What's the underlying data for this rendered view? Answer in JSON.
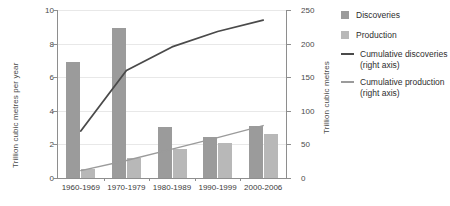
{
  "chart_data": {
    "type": "bar",
    "title": "",
    "subtitle": "",
    "categories": [
      "1960-1969",
      "1970-1979",
      "1980-1989",
      "1990-1999",
      "2000-2006"
    ],
    "ylabel": "Trillion cubic metres per year",
    "ylabel_right": "Trillion cubic metres",
    "xlabel": "",
    "ylim": [
      0,
      10
    ],
    "ylim_right": [
      0,
      250
    ],
    "yticks": [
      "0",
      "2",
      "4",
      "6",
      "8",
      "10"
    ],
    "yticks_right": [
      "0",
      "50",
      "100",
      "150",
      "200",
      "250"
    ],
    "grid": true,
    "legend_position": "right",
    "series": [
      {
        "name": "Discoveries",
        "kind": "bar",
        "axis": "left",
        "color": "#9b9b9b",
        "values": [
          6.9,
          8.9,
          3.05,
          2.45,
          3.1
        ]
      },
      {
        "name": "Production",
        "kind": "bar",
        "axis": "left",
        "color": "#b8b8b8",
        "values": [
          0.55,
          1.2,
          1.7,
          2.1,
          2.6
        ]
      },
      {
        "name": "Cumulative discoveries (right axis)",
        "kind": "line",
        "axis": "right",
        "color": "#4a4a4a",
        "values": [
          70,
          160,
          195,
          218,
          235
        ]
      },
      {
        "name": "Cumulative production (right axis)",
        "kind": "line",
        "axis": "right",
        "color": "#9b9b9b",
        "values": [
          11,
          26,
          43,
          60,
          78
        ]
      }
    ]
  },
  "legend": {
    "items": [
      {
        "label": "Discoveries",
        "sub": "",
        "marker": "square-swatch-icon",
        "color": "#9b9b9b"
      },
      {
        "label": "Production",
        "sub": "",
        "marker": "square-swatch-icon",
        "color": "#b8b8b8"
      },
      {
        "label": "Cumulative discoveries",
        "sub": "(right axis)",
        "marker": "line-swatch-icon",
        "color": "#4a4a4a"
      },
      {
        "label": "Cumulative production",
        "sub": "(right axis)",
        "marker": "line-swatch-icon",
        "color": "#9b9b9b"
      }
    ]
  }
}
